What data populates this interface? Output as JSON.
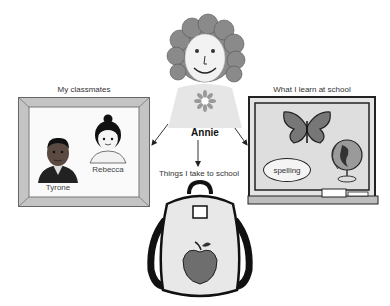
{
  "center": {
    "name": "Annie",
    "icon": "girl-portrait-icon"
  },
  "branches": [
    {
      "id": "classmates",
      "caption": "My classmates",
      "icon": "picture-frame-icon",
      "people": [
        {
          "name": "Tyrone",
          "icon": "boy-portrait-icon"
        },
        {
          "name": "Rebecca",
          "icon": "girl-portrait-icon"
        }
      ]
    },
    {
      "id": "learn",
      "caption": "What I learn at school",
      "icon": "chalkboard-icon",
      "items": [
        {
          "label": "butterfly",
          "icon": "butterfly-icon"
        },
        {
          "label": "globe",
          "icon": "globe-icon"
        },
        {
          "label": "spelling",
          "icon": "spelling-bubble"
        }
      ]
    },
    {
      "id": "take",
      "caption": "Things I take to school",
      "icon": "backpack-icon",
      "items": [
        {
          "label": "apple",
          "icon": "apple-icon"
        }
      ]
    }
  ],
  "colors": {
    "background": "#ffffff",
    "frame": "#b9b9b9",
    "board_border": "#222222",
    "board_fill": "#d9d9d9",
    "ink": "#1a1a1a"
  }
}
